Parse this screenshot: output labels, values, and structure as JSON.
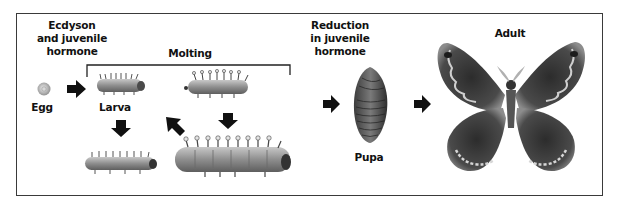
{
  "diagram": {
    "labels": {
      "ecdyson": "Ecdyson\nand juvenile\nhormone",
      "molting": "Molting",
      "reduction": "Reduction\nin juvenile\nhormone",
      "egg": "Egg",
      "larva": "Larva",
      "pupa": "Pupa",
      "adult": "Adult"
    },
    "stages": [
      "Egg",
      "Larva",
      "Pupa",
      "Adult"
    ],
    "icons": {
      "egg": "egg-icon",
      "larva": "caterpillar-icon",
      "pupa": "pupa-icon",
      "adult": "moth-icon",
      "arrow": "arrow-icon"
    },
    "colors": {
      "arrow": "#111111",
      "frame": "#3a3a3a",
      "caterpillar": "#8a8a8a",
      "pupa": "#5a5a5a",
      "wing": "#3f3f3f",
      "wing_edge": "#9a9a9a"
    }
  }
}
